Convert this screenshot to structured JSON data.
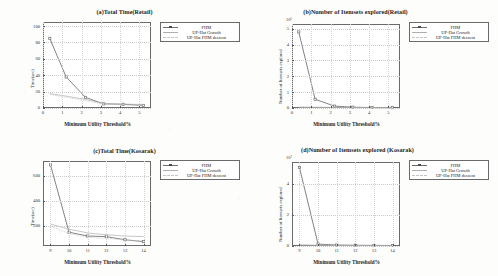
{
  "figure": {
    "legend_entries": [
      {
        "label": "FHM",
        "style": "solid-marker",
        "color": "#6d6d6d"
      },
      {
        "label": "UP-Hat Growth",
        "style": "solid-thin",
        "color": "#a8a8a8"
      },
      {
        "label": "UP-Hat FHM descent",
        "style": "dashed-thin",
        "color": "#bdbdbd"
      }
    ],
    "shared_xlabel": "Minimum Utility Threshold%"
  },
  "chart_data": [
    {
      "type": "line",
      "panel": "a",
      "title": "(a)Total Time(Retail)",
      "xlabel": "Minimum Utility Threshold%",
      "ylabel": "Time(sec)",
      "xlim": [
        0,
        5.6
      ],
      "ylim": [
        0,
        105
      ],
      "xticks": [
        "0",
        "1",
        "2",
        "3",
        "4",
        "5"
      ],
      "xtick_values": [
        0,
        1,
        2,
        3,
        4,
        5
      ],
      "yticks": [
        "0",
        "20",
        "40",
        "60",
        "80",
        "100"
      ],
      "ytick_values": [
        0,
        20,
        40,
        60,
        80,
        100
      ],
      "grid": true,
      "legend_position": "outside-right-top",
      "x": [
        0.35,
        1.2,
        2.2,
        3.15,
        4.15,
        5.2
      ],
      "series": [
        {
          "name": "FHM",
          "values": [
            85,
            38,
            13,
            5.0,
            4.5,
            3.2
          ]
        },
        {
          "name": "UP-Hat Growth",
          "values": [
            17.5,
            14.5,
            10.5,
            5.5,
            4.8,
            4.2
          ]
        },
        {
          "name": "UP-Hat FHM descent",
          "values": [
            16.5,
            13.0,
            9.0,
            4.5,
            4.0,
            2.6
          ]
        }
      ]
    },
    {
      "type": "line",
      "panel": "b",
      "title": "(b)Number of Itemsets explored(Retail)",
      "xlabel": "Minimum Utility Threshold%",
      "ylabel": "Number of Itemsets explored",
      "exponent_label": "10⁶",
      "xlim": [
        0,
        5.6
      ],
      "ylim": [
        0,
        5.3
      ],
      "xticks": [
        "0",
        "1",
        "2",
        "3",
        "4",
        "5"
      ],
      "xtick_values": [
        0,
        1,
        2,
        3,
        4,
        5
      ],
      "yticks": [
        "0",
        "1",
        "2",
        "3",
        "4",
        "5"
      ],
      "ytick_values": [
        0,
        1,
        2,
        3,
        4,
        5
      ],
      "grid": true,
      "legend_position": "outside-right-top",
      "x": [
        0.35,
        1.2,
        2.2,
        3.15,
        4.15,
        5.2
      ],
      "series": [
        {
          "name": "FHM",
          "values": [
            4.8,
            0.55,
            0.12,
            0.05,
            0.03,
            0.02
          ]
        },
        {
          "name": "UP-Hat Growth",
          "values": [
            0.06,
            0.05,
            0.04,
            0.03,
            0.02,
            0.02
          ]
        },
        {
          "name": "UP-Hat FHM descent",
          "values": [
            0.04,
            0.03,
            0.03,
            0.02,
            0.02,
            0.01
          ]
        }
      ]
    },
    {
      "type": "line",
      "panel": "c",
      "title": "(c)Total Time(Kosarak)",
      "xlabel": "Minimum Utility Threshold%",
      "ylabel": "Time(sec)",
      "xlim": [
        8.6,
        14.4
      ],
      "ylim": [
        40,
        720
      ],
      "xticks": [
        "9",
        "10",
        "11",
        "12",
        "13",
        "14"
      ],
      "xtick_values": [
        9,
        10,
        11,
        12,
        13,
        14
      ],
      "yticks": [
        "200",
        "400",
        "600"
      ],
      "ytick_values": [
        200,
        400,
        600
      ],
      "grid": true,
      "legend_position": "outside-right-top",
      "x": [
        9,
        10,
        11,
        12,
        13,
        14
      ],
      "series": [
        {
          "name": "FHM",
          "values": [
            690,
            150,
            120,
            115,
            90,
            75
          ]
        },
        {
          "name": "UP-Hat Growth",
          "values": [
            215,
            175,
            145,
            130,
            120,
            115
          ]
        },
        {
          "name": "UP-Hat FHM descent",
          "values": [
            200,
            140,
            110,
            100,
            88,
            80
          ]
        }
      ]
    },
    {
      "type": "line",
      "panel": "d",
      "title": "(d)Number of Itemsets explored (Kosarak)",
      "xlabel": "Minimum Utility Threshold%",
      "ylabel": "Number of Itemsets explored",
      "exponent_label": "10⁷",
      "xlim": [
        8.6,
        14.4
      ],
      "ylim": [
        0,
        5.4
      ],
      "xticks": [
        "9",
        "10",
        "11",
        "12",
        "13",
        "14"
      ],
      "xtick_values": [
        9,
        10,
        11,
        12,
        13,
        14
      ],
      "yticks": [
        "0",
        "2",
        "4"
      ],
      "ytick_values": [
        0,
        2,
        4
      ],
      "grid": true,
      "legend_position": "outside-right-top",
      "x": [
        9,
        10,
        11,
        12,
        13,
        14
      ],
      "series": [
        {
          "name": "FHM",
          "values": [
            5.05,
            0.12,
            0.06,
            0.05,
            0.04,
            0.03
          ]
        },
        {
          "name": "UP-Hat Growth",
          "values": [
            0.08,
            0.05,
            0.04,
            0.03,
            0.03,
            0.02
          ]
        },
        {
          "name": "UP-Hat FHM descent",
          "values": [
            0.05,
            0.04,
            0.03,
            0.02,
            0.02,
            0.02
          ]
        }
      ]
    }
  ]
}
